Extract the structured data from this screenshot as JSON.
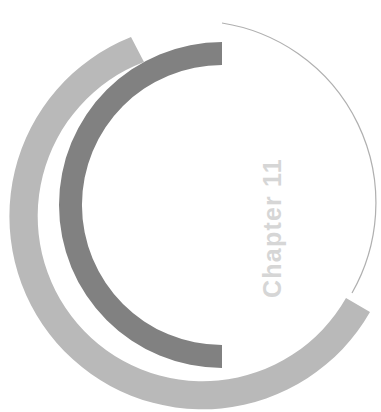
{
  "page": {
    "type": "chapter-opener-decorative-page",
    "background_color": "#ffffff",
    "width": 381,
    "height": 412
  },
  "heading": {
    "text": "Chapter 11",
    "chapter_word": "Chapter",
    "chapter_number": "11",
    "color": "#d6d6d6",
    "orientation": "rotated-90-counterclockwise"
  },
  "decoration": {
    "name": "concentric-open-rings",
    "center": {
      "x": 222,
      "y": 205
    },
    "rings": [
      {
        "name": "outer-light-ring",
        "color": "#b9b9b9",
        "outer_radius": 193,
        "inner_radius": 165,
        "start_angle_deg": 118,
        "end_angle_deg": 382
      },
      {
        "name": "inner-dark-ring",
        "color": "#818181",
        "outer_radius": 163,
        "inner_radius": 140,
        "start_angle_deg": 90,
        "end_angle_deg": 330
      },
      {
        "name": "hairline-circle-outline",
        "color": "#b0b0b0",
        "radius": 182,
        "stroke_width": 1,
        "start_angle_deg": 272,
        "end_angle_deg": 88
      }
    ]
  }
}
